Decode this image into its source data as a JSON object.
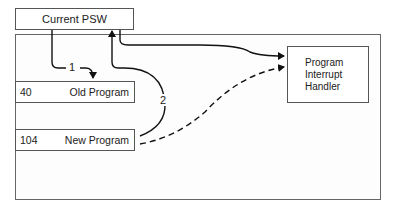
{
  "diagram": {
    "psw_box": {
      "label": "Current PSW"
    },
    "memory_slots": [
      {
        "address": "40",
        "label": "Old Program"
      },
      {
        "address": "104",
        "label": "New Program"
      }
    ],
    "handler_box": {
      "lines": [
        "Program",
        "Interrupt",
        "Handler"
      ]
    },
    "arrows": [
      {
        "label": "1",
        "from": "Current PSW",
        "to": "Old Program",
        "style": "solid"
      },
      {
        "label": "2",
        "from": "New Program",
        "to": "Current PSW",
        "style": "solid"
      },
      {
        "label": "",
        "from": "Current PSW",
        "to": "Program Interrupt Handler",
        "style": "solid"
      },
      {
        "label": "",
        "from": "New Program",
        "to": "Program Interrupt Handler",
        "style": "dashed"
      }
    ]
  }
}
